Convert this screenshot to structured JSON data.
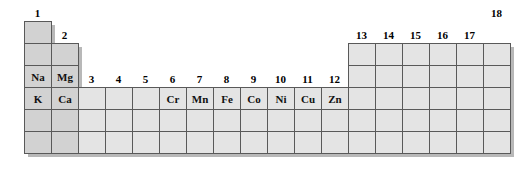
{
  "figure": {
    "kind": "periodic-table-fragment"
  },
  "colors": {
    "cell_fill": "#e4e4e4",
    "sblock_fill": "#d2d2d2",
    "cell_border": "#595959",
    "shadow": "#b8b8b8",
    "label_text": "#000000",
    "background": "#ffffff"
  },
  "geometry": {
    "col_width": 27,
    "row_height": 22,
    "grid_left": 24,
    "grid_top": 21
  },
  "group_labels": [
    {
      "text": "1",
      "col": 1,
      "row_above": 1
    },
    {
      "text": "2",
      "col": 2,
      "row_above": 2
    },
    {
      "text": "3",
      "col": 3,
      "row_above": 4
    },
    {
      "text": "4",
      "col": 4,
      "row_above": 4
    },
    {
      "text": "5",
      "col": 5,
      "row_above": 4
    },
    {
      "text": "6",
      "col": 6,
      "row_above": 4
    },
    {
      "text": "7",
      "col": 7,
      "row_above": 4
    },
    {
      "text": "8",
      "col": 8,
      "row_above": 4
    },
    {
      "text": "9",
      "col": 9,
      "row_above": 4
    },
    {
      "text": "10",
      "col": 10,
      "row_above": 4
    },
    {
      "text": "11",
      "col": 11,
      "row_above": 4
    },
    {
      "text": "12",
      "col": 12,
      "row_above": 4
    },
    {
      "text": "13",
      "col": 13,
      "row_above": 2
    },
    {
      "text": "14",
      "col": 14,
      "row_above": 2
    },
    {
      "text": "15",
      "col": 15,
      "row_above": 2
    },
    {
      "text": "16",
      "col": 16,
      "row_above": 2
    },
    {
      "text": "17",
      "col": 17,
      "row_above": 2
    },
    {
      "text": "18",
      "col": 18,
      "row_above": 1
    }
  ],
  "cells": [
    {
      "col": 1,
      "row": 1,
      "label": "",
      "block": "s"
    },
    {
      "col": 1,
      "row": 2,
      "label": "",
      "block": "s"
    },
    {
      "col": 2,
      "row": 2,
      "label": "",
      "block": "s"
    },
    {
      "col": 13,
      "row": 2,
      "label": "",
      "block": "p"
    },
    {
      "col": 14,
      "row": 2,
      "label": "",
      "block": "p"
    },
    {
      "col": 15,
      "row": 2,
      "label": "",
      "block": "p"
    },
    {
      "col": 16,
      "row": 2,
      "label": "",
      "block": "p"
    },
    {
      "col": 17,
      "row": 2,
      "label": "",
      "block": "p"
    },
    {
      "col": 18,
      "row": 2,
      "label": "",
      "block": "p"
    },
    {
      "col": 1,
      "row": 3,
      "label": "Na",
      "block": "s"
    },
    {
      "col": 2,
      "row": 3,
      "label": "Mg",
      "block": "s"
    },
    {
      "col": 13,
      "row": 3,
      "label": "",
      "block": "p"
    },
    {
      "col": 14,
      "row": 3,
      "label": "",
      "block": "p"
    },
    {
      "col": 15,
      "row": 3,
      "label": "",
      "block": "p"
    },
    {
      "col": 16,
      "row": 3,
      "label": "",
      "block": "p"
    },
    {
      "col": 17,
      "row": 3,
      "label": "",
      "block": "p"
    },
    {
      "col": 18,
      "row": 3,
      "label": "",
      "block": "p"
    },
    {
      "col": 1,
      "row": 4,
      "label": "K",
      "block": "s"
    },
    {
      "col": 2,
      "row": 4,
      "label": "Ca",
      "block": "s"
    },
    {
      "col": 3,
      "row": 4,
      "label": "",
      "block": "d"
    },
    {
      "col": 4,
      "row": 4,
      "label": "",
      "block": "d"
    },
    {
      "col": 5,
      "row": 4,
      "label": "",
      "block": "d"
    },
    {
      "col": 6,
      "row": 4,
      "label": "Cr",
      "block": "d"
    },
    {
      "col": 7,
      "row": 4,
      "label": "Mn",
      "block": "d"
    },
    {
      "col": 8,
      "row": 4,
      "label": "Fe",
      "block": "d"
    },
    {
      "col": 9,
      "row": 4,
      "label": "Co",
      "block": "d"
    },
    {
      "col": 10,
      "row": 4,
      "label": "Ni",
      "block": "d"
    },
    {
      "col": 11,
      "row": 4,
      "label": "Cu",
      "block": "d"
    },
    {
      "col": 12,
      "row": 4,
      "label": "Zn",
      "block": "d"
    },
    {
      "col": 13,
      "row": 4,
      "label": "",
      "block": "p"
    },
    {
      "col": 14,
      "row": 4,
      "label": "",
      "block": "p"
    },
    {
      "col": 15,
      "row": 4,
      "label": "",
      "block": "p"
    },
    {
      "col": 16,
      "row": 4,
      "label": "",
      "block": "p"
    },
    {
      "col": 17,
      "row": 4,
      "label": "",
      "block": "p"
    },
    {
      "col": 18,
      "row": 4,
      "label": "",
      "block": "p"
    },
    {
      "col": 1,
      "row": 5,
      "label": "",
      "block": "s"
    },
    {
      "col": 2,
      "row": 5,
      "label": "",
      "block": "s"
    },
    {
      "col": 3,
      "row": 5,
      "label": "",
      "block": "d"
    },
    {
      "col": 4,
      "row": 5,
      "label": "",
      "block": "d"
    },
    {
      "col": 5,
      "row": 5,
      "label": "",
      "block": "d"
    },
    {
      "col": 6,
      "row": 5,
      "label": "",
      "block": "d"
    },
    {
      "col": 7,
      "row": 5,
      "label": "",
      "block": "d"
    },
    {
      "col": 8,
      "row": 5,
      "label": "",
      "block": "d"
    },
    {
      "col": 9,
      "row": 5,
      "label": "",
      "block": "d"
    },
    {
      "col": 10,
      "row": 5,
      "label": "",
      "block": "d"
    },
    {
      "col": 11,
      "row": 5,
      "label": "",
      "block": "d"
    },
    {
      "col": 12,
      "row": 5,
      "label": "",
      "block": "d"
    },
    {
      "col": 13,
      "row": 5,
      "label": "",
      "block": "p"
    },
    {
      "col": 14,
      "row": 5,
      "label": "",
      "block": "p"
    },
    {
      "col": 15,
      "row": 5,
      "label": "",
      "block": "p"
    },
    {
      "col": 16,
      "row": 5,
      "label": "",
      "block": "p"
    },
    {
      "col": 17,
      "row": 5,
      "label": "",
      "block": "p"
    },
    {
      "col": 18,
      "row": 5,
      "label": "",
      "block": "p"
    },
    {
      "col": 1,
      "row": 6,
      "label": "",
      "block": "s"
    },
    {
      "col": 2,
      "row": 6,
      "label": "",
      "block": "s"
    },
    {
      "col": 3,
      "row": 6,
      "label": "",
      "block": "d"
    },
    {
      "col": 4,
      "row": 6,
      "label": "",
      "block": "d"
    },
    {
      "col": 5,
      "row": 6,
      "label": "",
      "block": "d"
    },
    {
      "col": 6,
      "row": 6,
      "label": "",
      "block": "d"
    },
    {
      "col": 7,
      "row": 6,
      "label": "",
      "block": "d"
    },
    {
      "col": 8,
      "row": 6,
      "label": "",
      "block": "d"
    },
    {
      "col": 9,
      "row": 6,
      "label": "",
      "block": "d"
    },
    {
      "col": 10,
      "row": 6,
      "label": "",
      "block": "d"
    },
    {
      "col": 11,
      "row": 6,
      "label": "",
      "block": "d"
    },
    {
      "col": 12,
      "row": 6,
      "label": "",
      "block": "d"
    },
    {
      "col": 13,
      "row": 6,
      "label": "",
      "block": "p"
    },
    {
      "col": 14,
      "row": 6,
      "label": "",
      "block": "p"
    },
    {
      "col": 15,
      "row": 6,
      "label": "",
      "block": "p"
    },
    {
      "col": 16,
      "row": 6,
      "label": "",
      "block": "p"
    },
    {
      "col": 17,
      "row": 6,
      "label": "",
      "block": "p"
    },
    {
      "col": 18,
      "row": 6,
      "label": "",
      "block": "p"
    }
  ]
}
